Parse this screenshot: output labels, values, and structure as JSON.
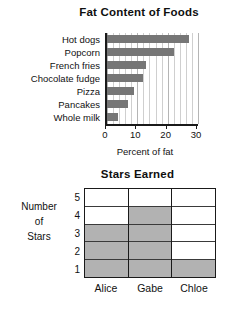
{
  "page": {
    "background": "#ffffff",
    "bar_color": "#767676",
    "cell_fill_color": "#b2b2b2",
    "axis_color": "#1a1a1a"
  },
  "chart_data": [
    {
      "type": "bar",
      "orientation": "horizontal",
      "title": "Fat Content of Foods",
      "xlabel": "Percent of fat",
      "ylabel": "",
      "categories": [
        "Hot dogs",
        "Popcorn",
        "French fries",
        "Chocolate fudge",
        "Pizza",
        "Pancakes",
        "Whole milk"
      ],
      "values": [
        27,
        22,
        13,
        12,
        9,
        7,
        3.5
      ],
      "xlim": [
        0,
        30
      ],
      "xticks": [
        0,
        10,
        20,
        30
      ],
      "xtick_labels": [
        "0",
        "10",
        "20",
        "30"
      ],
      "minor_gridline_step": 2,
      "grid": true,
      "legend": null
    },
    {
      "type": "bar",
      "orientation": "vertical",
      "style": "grid-blocks",
      "title": "Stars Earned",
      "xlabel": "",
      "ylabel": "Number of Stars",
      "ylabel_lines": [
        "Number",
        "of",
        "Stars"
      ],
      "categories": [
        "Alice",
        "Gabe",
        "Chloe"
      ],
      "values": [
        3,
        4,
        1
      ],
      "ylim": [
        0,
        5
      ],
      "yticks": [
        1,
        2,
        3,
        4,
        5
      ],
      "ytick_labels_top_to_bottom": [
        "5",
        "4",
        "3",
        "2",
        "1"
      ],
      "grid": true,
      "legend": null
    }
  ],
  "fat_chart": {
    "title": "Fat Content of Foods",
    "x_axis_title": "Percent of fat",
    "categories": [
      {
        "label": "Hot dogs",
        "value": 27
      },
      {
        "label": "Popcorn",
        "value": 22
      },
      {
        "label": "French fries",
        "value": 13
      },
      {
        "label": "Chocolate fudge",
        "value": 12
      },
      {
        "label": "Pizza",
        "value": 9
      },
      {
        "label": "Pancakes",
        "value": 7
      },
      {
        "label": "Whole milk",
        "value": 3.5
      }
    ],
    "ticks": [
      {
        "label": "0",
        "value": 0
      },
      {
        "label": "10",
        "value": 10
      },
      {
        "label": "20",
        "value": 20
      },
      {
        "label": "30",
        "value": 30
      }
    ],
    "max": 30
  },
  "stars_chart": {
    "title": "Stars Earned",
    "y_axis_title_lines": [
      "Number",
      "of",
      "Stars"
    ],
    "y_labels_top_to_bottom": [
      "5",
      "4",
      "3",
      "2",
      "1"
    ],
    "columns": [
      {
        "label": "Alice",
        "value": 3
      },
      {
        "label": "Gabe",
        "value": 4
      },
      {
        "label": "Chloe",
        "value": 1
      }
    ],
    "max": 5
  }
}
